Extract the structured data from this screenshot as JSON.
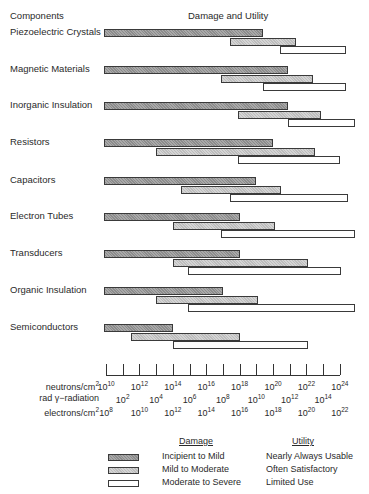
{
  "header": {
    "components": "Components",
    "title": "Damage and Utility"
  },
  "chart_data": {
    "type": "bar",
    "subtype": "horizontal range (gantt-like), log scale",
    "title": "Damage and Utility",
    "ylabel": "Components",
    "xlabel": "Radiation dose (log scale)",
    "categories": [
      "Piezoelectric Crystals",
      "Magnetic Materials",
      "Inorganic Insulation",
      "Resistors",
      "Capacitors",
      "Electron Tubes",
      "Transducers",
      "Organic Insulation",
      "Semiconductors"
    ],
    "x_unit": "log10(neutrons/cm2)",
    "xlim": [
      10,
      24
    ],
    "series": [
      {
        "name": "Incipient to Mild",
        "utility": "Nearly Always Usable",
        "color": "#8c8c8c",
        "ranges": [
          [
            10,
            19.4
          ],
          [
            10,
            20.9
          ],
          [
            10,
            20.9
          ],
          [
            10,
            20.0
          ],
          [
            10,
            19.0
          ],
          [
            10,
            18.0
          ],
          [
            10,
            18.0
          ],
          [
            10,
            17.0
          ],
          [
            10,
            14.0
          ]
        ]
      },
      {
        "name": "Mild to Moderate",
        "utility": "Often Satisfactory",
        "color": "#bdbdbd",
        "ranges": [
          [
            17.4,
            21.4
          ],
          [
            16.9,
            22.4
          ],
          [
            17.9,
            22.9
          ],
          [
            13.0,
            22.5
          ],
          [
            14.5,
            20.5
          ],
          [
            14.0,
            20.1
          ],
          [
            14.0,
            22.1
          ],
          [
            13.0,
            19.1
          ],
          [
            11.5,
            18.0
          ]
        ]
      },
      {
        "name": "Moderate to Severe",
        "utility": "Limited Use",
        "color": "#ffffff",
        "ranges": [
          [
            20.4,
            24.4
          ],
          [
            19.4,
            24.4
          ],
          [
            20.9,
            24.9
          ],
          [
            17.9,
            24.0
          ],
          [
            17.4,
            24.5
          ],
          [
            16.9,
            24.9
          ],
          [
            14.9,
            24.1
          ],
          [
            14.9,
            24.9
          ],
          [
            14.0,
            22.1
          ]
        ]
      }
    ],
    "axes": [
      {
        "label": "neutrons/cm2",
        "ticks": [
          "10^10",
          "10^12",
          "10^14",
          "10^16",
          "10^18",
          "10^20",
          "10^22",
          "10^24"
        ]
      },
      {
        "label": "rad γ-radiation",
        "ticks": [
          "10^2",
          "10^4",
          "10^6",
          "10^8",
          "10^10",
          "10^12",
          "10^14"
        ]
      },
      {
        "label": "electrons/cm2",
        "ticks": [
          "10^8",
          "10^10",
          "10^12",
          "10^14",
          "10^16",
          "10^18",
          "10^20",
          "10^22"
        ]
      }
    ],
    "grid": false,
    "legend_position": "bottom"
  },
  "components": [
    {
      "label": "Piezoelectric Crystals"
    },
    {
      "label": "Magnetic Materials"
    },
    {
      "label": "Inorganic Insulation"
    },
    {
      "label": "Resistors"
    },
    {
      "label": "Capacitors"
    },
    {
      "label": "Electron Tubes"
    },
    {
      "label": "Transducers"
    },
    {
      "label": "Organic Insulation"
    },
    {
      "label": "Semiconductors"
    }
  ],
  "scales": {
    "neutrons": {
      "label": "neutrons/cm",
      "sup": "2",
      "ticks": [
        [
          "10",
          "10"
        ],
        [
          "10",
          "12"
        ],
        [
          "10",
          "14"
        ],
        [
          "10",
          "16"
        ],
        [
          "10",
          "18"
        ],
        [
          "10",
          "20"
        ],
        [
          "10",
          "22"
        ],
        [
          "10",
          "24"
        ]
      ]
    },
    "gamma": {
      "label": "rad γ−radiation",
      "ticks": [
        [
          "10",
          "2"
        ],
        [
          "10",
          "4"
        ],
        [
          "10",
          "6"
        ],
        [
          "10",
          "8"
        ],
        [
          "10",
          "10"
        ],
        [
          "10",
          "12"
        ],
        [
          "10",
          "14"
        ]
      ]
    },
    "electrons": {
      "label": "electrons/cm",
      "sup": "2",
      "ticks": [
        [
          "10",
          "8"
        ],
        [
          "10",
          "10"
        ],
        [
          "10",
          "12"
        ],
        [
          "10",
          "14"
        ],
        [
          "10",
          "16"
        ],
        [
          "10",
          "18"
        ],
        [
          "10",
          "20"
        ],
        [
          "10",
          "22"
        ]
      ]
    }
  },
  "legend": {
    "damage_header": "Damage",
    "utility_header": "Utility",
    "items": [
      {
        "damage": "Incipient to Mild",
        "utility": "Nearly Always Usable"
      },
      {
        "damage": "Mild to Moderate",
        "utility": "Often Satisfactory"
      },
      {
        "damage": "Moderate to Severe",
        "utility": "Limited Use"
      }
    ]
  }
}
